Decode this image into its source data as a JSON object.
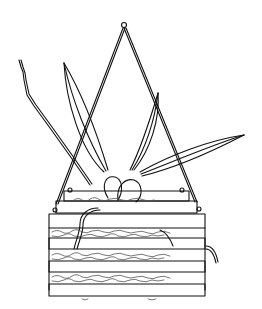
{
  "illustration": {
    "subject": "Orchid plant growing in a hanging slatted wooden basket",
    "style": "black ink line drawing",
    "colors": {
      "ink": "#111111",
      "paper": "#ffffff",
      "moss": "#555555"
    }
  }
}
